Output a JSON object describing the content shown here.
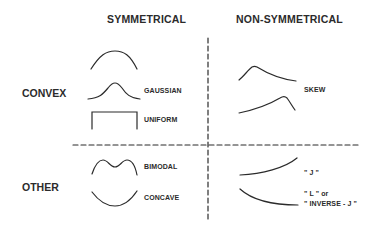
{
  "diagram": {
    "column_headers": [
      "SYMMETRICAL",
      "NON-SYMMETRICAL"
    ],
    "row_headers": [
      "CONVEX",
      "OTHER"
    ],
    "shapes": {
      "convex_symmetrical": [
        {
          "name": "unlabeled-broad-hump",
          "label": ""
        },
        {
          "name": "gaussian",
          "label": "GAUSSIAN"
        },
        {
          "name": "uniform",
          "label": "UNIFORM"
        }
      ],
      "convex_nonsymmetrical": [
        {
          "name": "right-skew",
          "label": ""
        },
        {
          "name": "left-skew",
          "label": ""
        },
        {
          "group_label": "SKEW"
        }
      ],
      "other_symmetrical": [
        {
          "name": "bimodal",
          "label": "BIMODAL"
        },
        {
          "name": "concave",
          "label": "CONCAVE"
        }
      ],
      "other_nonsymmetrical": [
        {
          "name": "j-shape",
          "label": "\" J \""
        },
        {
          "name": "l-shape",
          "label_line1": "\" L \" or",
          "label_line2": "\" INVERSE - J \""
        }
      ]
    },
    "colors": {
      "line": "#2b2b2b",
      "background": "#ffffff"
    }
  }
}
